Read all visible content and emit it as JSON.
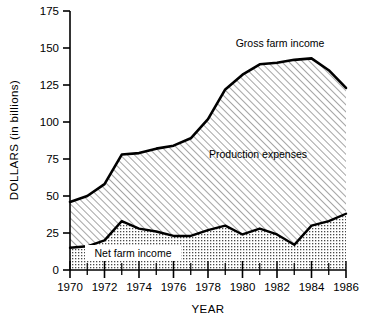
{
  "chart_data": {
    "type": "area",
    "title": "",
    "xlabel": "YEAR",
    "ylabel": "DOLLARS (in billions)",
    "xlim": [
      1970,
      1986
    ],
    "ylim": [
      0,
      175
    ],
    "grid": false,
    "stacked": true,
    "legend_position": "inline-annotations",
    "x": [
      1970,
      1971,
      1972,
      1973,
      1974,
      1975,
      1976,
      1977,
      1978,
      1979,
      1980,
      1981,
      1982,
      1983,
      1984,
      1985,
      1986
    ],
    "y_ticks": [
      0,
      25,
      50,
      75,
      100,
      125,
      150,
      175
    ],
    "x_ticks_major": [
      1970,
      1972,
      1974,
      1976,
      1978,
      1980,
      1982,
      1984,
      1986
    ],
    "x_ticks_minor": [
      1971,
      1973,
      1975,
      1977,
      1979,
      1981,
      1983,
      1985
    ],
    "series": [
      {
        "name": "Gross farm income",
        "fill": "diagonal-hatch",
        "values": [
          46,
          50,
          58,
          78,
          79,
          82,
          84,
          89,
          102,
          122,
          132,
          139,
          140,
          142,
          143,
          135,
          123
        ]
      },
      {
        "name": "Net farm income",
        "fill": "dotted-stipple",
        "values": [
          15,
          16,
          20,
          33,
          28,
          26,
          23,
          23,
          27,
          30,
          24,
          28,
          24,
          17,
          30,
          33,
          38
        ]
      }
    ],
    "annotations": [
      {
        "text": "Gross farm income",
        "x": 1980.0,
        "y": 160
      },
      {
        "text": "Production expenses",
        "x": 1980.5,
        "y": 88
      },
      {
        "text": "Net farm income",
        "x": 1974.6,
        "y": 10
      }
    ]
  },
  "axes": {
    "y_tick_labels": [
      "175",
      "150",
      "125",
      "100",
      "75",
      "50",
      "25",
      "0"
    ],
    "x_tick_labels": [
      "1970",
      "1972",
      "1974",
      "1976",
      "1978",
      "1980",
      "1982",
      "1984",
      "1986"
    ],
    "y_axis_title": "DOLLARS (in billions)",
    "x_axis_title": "YEAR"
  },
  "labels": {
    "gross_farm_income": "Gross farm income",
    "production_expenses": "Production expenses",
    "net_farm_income": "Net farm income"
  },
  "colors": {
    "line": "#000000",
    "text": "#000000",
    "background": "#ffffff",
    "hatch": "#555555",
    "stipple": "#4a4a4a"
  }
}
